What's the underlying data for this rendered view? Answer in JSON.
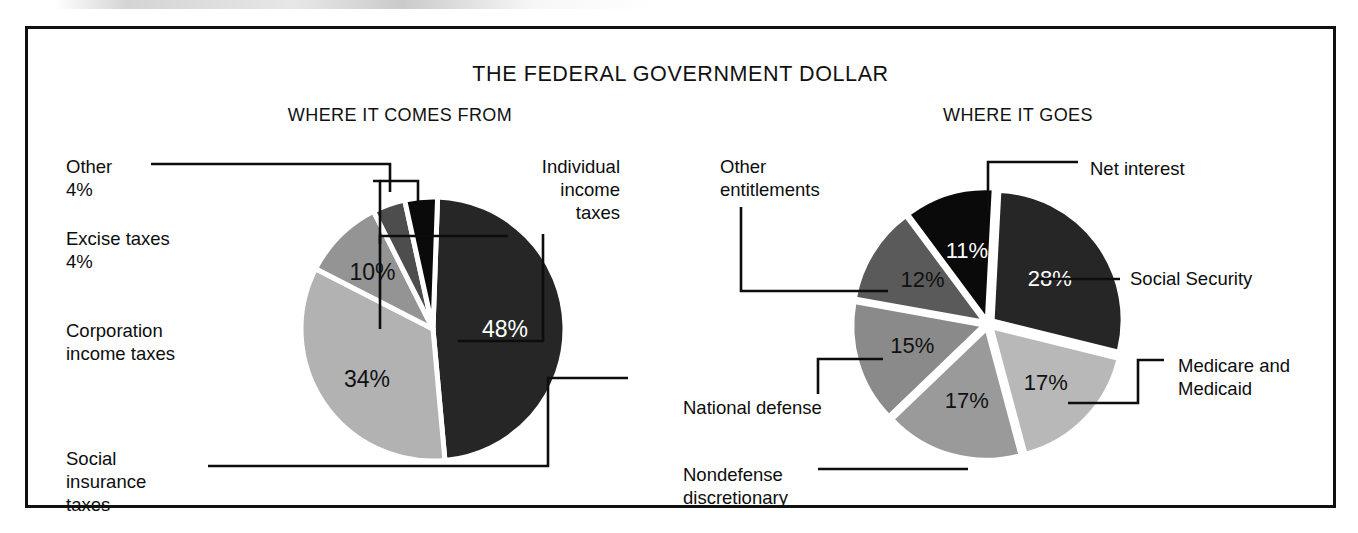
{
  "figure": {
    "title": "THE FEDERAL GOVERNMENT DOLLAR",
    "panels": [
      {
        "id": "comes-from",
        "subtitle": "WHERE IT COMES FROM"
      },
      {
        "id": "goes",
        "subtitle": "WHERE IT GOES"
      }
    ]
  },
  "colors": {
    "near_black": "#262626",
    "black": "#0a0a0a",
    "dark_gray": "#4d4d4d",
    "mid_gray": "#7a7a7a",
    "gray": "#949494",
    "light_gray": "#b2b2b2",
    "pale_gray": "#c6c6c6",
    "outline": "#111111",
    "background": "#ffffff",
    "label_text": "#0d0d0d",
    "value_on_dark": "#ffffff",
    "value_on_light": "#111111"
  },
  "left_pie": {
    "slices": [
      {
        "label": "Individual\nincome\ntaxes",
        "value_text": "48%",
        "value": 48,
        "color": "#262626",
        "value_color": "#ffffff"
      },
      {
        "label": "Social\ninsurance\ntaxes",
        "value_text": "34%",
        "value": 34,
        "color": "#b2b2b2",
        "value_color": "#111111"
      },
      {
        "label": "Corporation\nincome taxes",
        "value_text": "10%",
        "value": 10,
        "color": "#949494",
        "value_color": "#111111"
      },
      {
        "label": "Excise taxes\n4%",
        "value_text": "4%",
        "value": 4,
        "color": "#4d4d4d",
        "value_color": "#111111"
      },
      {
        "label": "Other\n4%",
        "value_text": "4%",
        "value": 4,
        "color": "#0a0a0a",
        "value_color": "#111111"
      }
    ]
  },
  "right_pie": {
    "slices": [
      {
        "label": "Social Security",
        "value_text": "28%",
        "value": 28,
        "color": "#262626",
        "value_color": "#ffffff"
      },
      {
        "label": "Medicare and\nMedicaid",
        "value_text": "17%",
        "value": 17,
        "color": "#b8b8b8",
        "value_color": "#111111"
      },
      {
        "label": "Nondefense\ndiscretionary",
        "value_text": "17%",
        "value": 17,
        "color": "#9a9a9a",
        "value_color": "#111111"
      },
      {
        "label": "National defense",
        "value_text": "15%",
        "value": 15,
        "color": "#8a8a8a",
        "value_color": "#111111"
      },
      {
        "label": "Other\nentitlements",
        "value_text": "12%",
        "value": 12,
        "color": "#5a5a5a",
        "value_color": "#111111"
      },
      {
        "label": "Net interest",
        "value_text": "11%",
        "value": 11,
        "color": "#0a0a0a",
        "value_color": "#ffffff"
      }
    ]
  },
  "chart_data": [
    {
      "type": "pie",
      "title": "WHERE IT COMES FROM",
      "subtitle": "THE FEDERAL GOVERNMENT DOLLAR",
      "categories": [
        "Individual income taxes",
        "Social insurance taxes",
        "Corporation income taxes",
        "Excise taxes",
        "Other"
      ],
      "values": [
        48,
        34,
        10,
        4,
        4
      ],
      "value_labels": [
        "48%",
        "34%",
        "10%",
        "4%",
        "4%"
      ],
      "units": "percent",
      "legend": "none",
      "labels_position": "callout-leader-lines",
      "slice_colors": [
        "#262626",
        "#b2b2b2",
        "#949494",
        "#4d4d4d",
        "#0a0a0a"
      ],
      "start_angle_deg": 0,
      "direction": "clockwise"
    },
    {
      "type": "pie",
      "title": "WHERE IT GOES",
      "subtitle": "THE FEDERAL GOVERNMENT DOLLAR",
      "categories": [
        "Social Security",
        "Medicare and Medicaid",
        "Nondefense discretionary",
        "National defense",
        "Other entitlements",
        "Net interest"
      ],
      "values": [
        28,
        17,
        17,
        15,
        12,
        11
      ],
      "value_labels": [
        "28%",
        "17%",
        "17%",
        "15%",
        "12%",
        "11%"
      ],
      "units": "percent",
      "legend": "none",
      "labels_position": "callout-leader-lines",
      "slice_colors": [
        "#262626",
        "#b8b8b8",
        "#9a9a9a",
        "#8a8a8a",
        "#5a5a5a",
        "#0a0a0a"
      ],
      "start_angle_deg": 0,
      "direction": "clockwise",
      "exploded": true
    }
  ],
  "values": {
    "left": {
      "individual": "48%",
      "social_insurance": "34%",
      "corporation": "10%",
      "excise": "4%",
      "other": "4%"
    },
    "right": {
      "social_security": "28%",
      "medicare": "17%",
      "nondefense": "17%",
      "defense": "15%",
      "other_entitlements": "12%",
      "net_interest": "11%"
    }
  },
  "labels": {
    "left": {
      "other": "Other\n4%",
      "excise": "Excise taxes\n4%",
      "corporation": "Corporation\nincome taxes",
      "social_insurance": "Social\ninsurance\ntaxes",
      "individual": "Individual\nincome\ntaxes"
    },
    "right": {
      "other_entitlements": "Other\nentitlements",
      "net_interest": "Net interest",
      "social_security": "Social Security",
      "medicare": "Medicare and\nMedicaid",
      "national_defense": "National defense",
      "nondefense": "Nondefense\ndiscretionary"
    }
  }
}
